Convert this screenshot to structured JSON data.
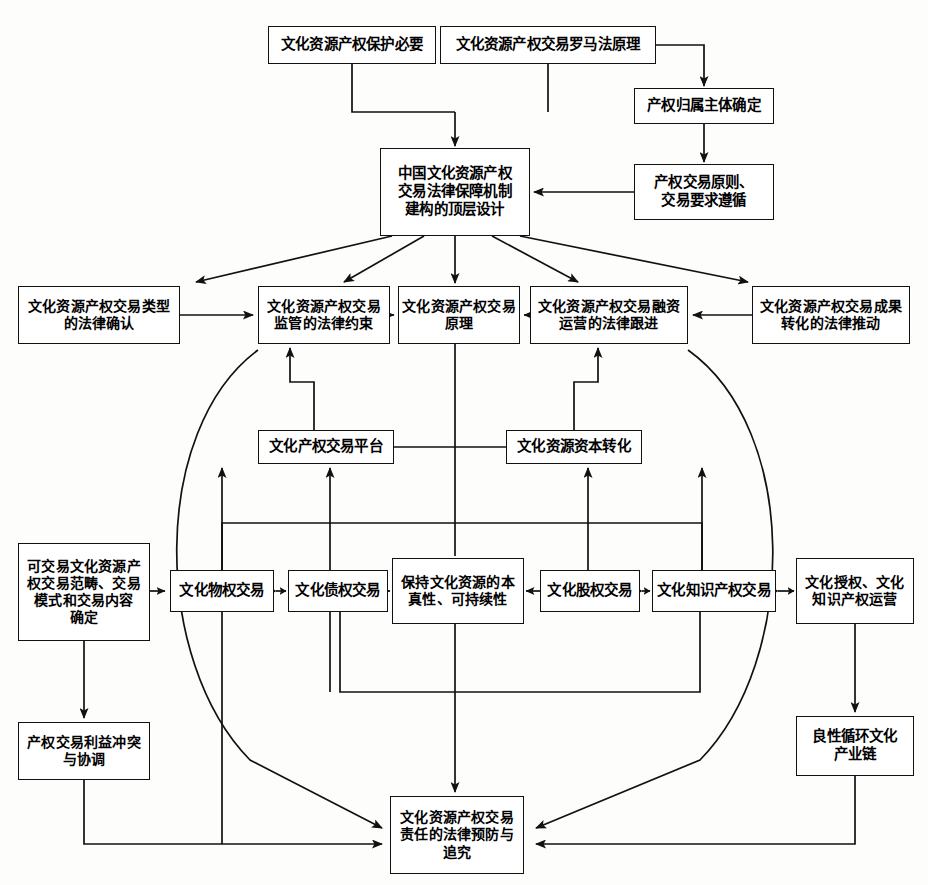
{
  "diagram": {
    "type": "flowchart",
    "background_color": "#fdfdfc",
    "box_border_color": "#111111",
    "box_fill_color": "#ffffff",
    "line_color": "#111111",
    "nodes": [
      {
        "id": "n1",
        "label": "文化资源产权保护必要",
        "x": 268,
        "y": 26,
        "w": 168,
        "h": 38
      },
      {
        "id": "n2",
        "label": "文化资源产权交易罗马法原理",
        "x": 440,
        "y": 26,
        "w": 216,
        "h": 38
      },
      {
        "id": "n3",
        "label": "产权归属主体确定",
        "x": 634,
        "y": 88,
        "w": 140,
        "h": 36
      },
      {
        "id": "n4",
        "label": "产权交易原则、\n交易要求遵循",
        "x": 634,
        "y": 164,
        "w": 140,
        "h": 56
      },
      {
        "id": "n5",
        "label": "中国文化资源产权\n交易法律保障机制\n建构的顶层设计",
        "x": 380,
        "y": 148,
        "w": 150,
        "h": 88
      },
      {
        "id": "n6",
        "label": "文化资源产权交易类型\n的法律确认",
        "x": 18,
        "y": 286,
        "w": 162,
        "h": 58
      },
      {
        "id": "n7",
        "label": "文化资源产权交易\n监管的法律约束",
        "x": 258,
        "y": 286,
        "w": 132,
        "h": 58
      },
      {
        "id": "n8",
        "label": "文化资源产权交易\n原理",
        "x": 398,
        "y": 286,
        "w": 122,
        "h": 58
      },
      {
        "id": "n9",
        "label": "文化资源产权交易融资\n运营的法律跟进",
        "x": 530,
        "y": 286,
        "w": 158,
        "h": 58
      },
      {
        "id": "n10",
        "label": "文化资源产权交易成果\n转化的法律推动",
        "x": 752,
        "y": 286,
        "w": 158,
        "h": 58
      },
      {
        "id": "n11",
        "label": "文化产权交易平台",
        "x": 258,
        "y": 430,
        "w": 136,
        "h": 34
      },
      {
        "id": "n12",
        "label": "文化资源资本转化",
        "x": 506,
        "y": 430,
        "w": 136,
        "h": 34
      },
      {
        "id": "n13",
        "label": "可交易文化资源产\n权交易范畴、交易\n模式和交易内容\n确定",
        "x": 18,
        "y": 543,
        "w": 132,
        "h": 98
      },
      {
        "id": "n14",
        "label": "文化物权交易",
        "x": 170,
        "y": 570,
        "w": 104,
        "h": 42
      },
      {
        "id": "n15",
        "label": "文化债权交易",
        "x": 288,
        "y": 570,
        "w": 100,
        "h": 42
      },
      {
        "id": "n16",
        "label": "保持文化资源的本\n真性、可持续性",
        "x": 392,
        "y": 558,
        "w": 132,
        "h": 66
      },
      {
        "id": "n17",
        "label": "文化股权交易",
        "x": 540,
        "y": 570,
        "w": 100,
        "h": 42
      },
      {
        "id": "n18",
        "label": "文化知识产权交易",
        "x": 652,
        "y": 570,
        "w": 124,
        "h": 42
      },
      {
        "id": "n19",
        "label": "文化授权、文化\n知识产权运营",
        "x": 796,
        "y": 558,
        "w": 118,
        "h": 66
      },
      {
        "id": "n20",
        "label": "产权交易利益冲突\n与协调",
        "x": 18,
        "y": 722,
        "w": 132,
        "h": 58
      },
      {
        "id": "n21",
        "label": "良性循环文化\n产业链",
        "x": 796,
        "y": 716,
        "w": 118,
        "h": 60
      },
      {
        "id": "n22",
        "label": "文化资源产权交易\n责任的法律预防与\n追究",
        "x": 390,
        "y": 796,
        "w": 134,
        "h": 78
      }
    ],
    "edges": [
      {
        "from": "n1",
        "to": "n5",
        "style": "orthogonal-down",
        "arrow": "single"
      },
      {
        "from": "n2",
        "to": "n5",
        "style": "orthogonal-down",
        "arrow": "single"
      },
      {
        "from": "n2",
        "to": "n3",
        "style": "orthogonal-right-down",
        "arrow": "single"
      },
      {
        "from": "n3",
        "to": "n4",
        "style": "straight-down",
        "arrow": "single"
      },
      {
        "from": "n4",
        "to": "n5",
        "style": "straight-left",
        "arrow": "single"
      },
      {
        "from": "n5",
        "to": "n6",
        "style": "diagonal",
        "arrow": "single"
      },
      {
        "from": "n5",
        "to": "n7",
        "style": "diagonal",
        "arrow": "single"
      },
      {
        "from": "n5",
        "to": "n8",
        "style": "straight-down",
        "arrow": "single"
      },
      {
        "from": "n5",
        "to": "n9",
        "style": "diagonal",
        "arrow": "single"
      },
      {
        "from": "n5",
        "to": "n10",
        "style": "diagonal",
        "arrow": "single"
      },
      {
        "from": "n6",
        "to": "n7",
        "style": "straight-right",
        "arrow": "single"
      },
      {
        "from": "n7",
        "to": "n8",
        "style": "straight-right",
        "arrow": "single"
      },
      {
        "from": "n9",
        "to": "n8",
        "style": "straight-left",
        "arrow": "single"
      },
      {
        "from": "n10",
        "to": "n9",
        "style": "straight-left",
        "arrow": "single"
      },
      {
        "from": "n11",
        "to": "n7",
        "style": "orthogonal-up",
        "arrow": "single"
      },
      {
        "from": "n12",
        "to": "n9",
        "style": "orthogonal-up",
        "arrow": "single"
      },
      {
        "from": "n11",
        "to": "n12",
        "style": "straight-right",
        "arrow": "none"
      },
      {
        "from": "n14",
        "to": "n11",
        "style": "straight-up",
        "arrow": "single"
      },
      {
        "from": "n15",
        "to": "n11",
        "style": "straight-up",
        "arrow": "single"
      },
      {
        "from": "n17",
        "to": "n12",
        "style": "straight-up",
        "arrow": "single"
      },
      {
        "from": "n18",
        "to": "n12",
        "style": "straight-up",
        "arrow": "single"
      },
      {
        "from": "n13",
        "to": "n14",
        "style": "straight-right",
        "arrow": "single"
      },
      {
        "from": "n14",
        "to": "n15",
        "style": "straight-right",
        "arrow": "double"
      },
      {
        "from": "n15",
        "to": "n16",
        "style": "straight-right",
        "arrow": "single"
      },
      {
        "from": "n17",
        "to": "n16",
        "style": "straight-left",
        "arrow": "single"
      },
      {
        "from": "n17",
        "to": "n18",
        "style": "straight-right",
        "arrow": "double"
      },
      {
        "from": "n18",
        "to": "n19",
        "style": "straight-right",
        "arrow": "double"
      },
      {
        "from": "n13",
        "to": "n20",
        "style": "straight-down",
        "arrow": "single"
      },
      {
        "from": "n19",
        "to": "n21",
        "style": "straight-down",
        "arrow": "single"
      },
      {
        "from": "n16",
        "to": "n22",
        "style": "straight-down",
        "arrow": "single"
      },
      {
        "from": "n20",
        "to": "n22",
        "style": "orthogonal-down-right",
        "arrow": "single"
      },
      {
        "from": "n21",
        "to": "n22",
        "style": "orthogonal-down-left",
        "arrow": "single"
      },
      {
        "from": "n6",
        "to": "n22",
        "style": "curve",
        "arrow": "single"
      },
      {
        "from": "n10",
        "to": "n22",
        "style": "curve",
        "arrow": "single"
      },
      {
        "from": "n7",
        "to": "n14",
        "style": "curve-down",
        "arrow": "single"
      },
      {
        "from": "n9",
        "to": "n18",
        "style": "curve-down",
        "arrow": "single"
      },
      {
        "from": "n14",
        "to": "n7",
        "style": "orthogonal-loop-up",
        "arrow": "single"
      },
      {
        "from": "n18",
        "to": "n9",
        "style": "orthogonal-loop-up",
        "arrow": "single"
      },
      {
        "from": "n14",
        "to": "n22",
        "style": "orthogonal-down-right",
        "arrow": "none"
      },
      {
        "from": "n15",
        "to": "n18",
        "style": "orthogonal-loop-down",
        "arrow": "none"
      }
    ]
  }
}
